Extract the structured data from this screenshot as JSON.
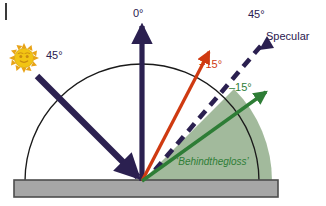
{
  "figure": {
    "background": "#ffffff"
  },
  "colors": {
    "navy": "#2b2050",
    "navy_dark": "#241a4a",
    "red": "#cf3a11",
    "green": "#2e7d36",
    "green_fill": "#9ab494",
    "substrate_fill": "#a6a6a6",
    "substrate_stroke": "#4d4d4d",
    "arc_stroke": "#1a1a1a",
    "sun_body": "#f2c413",
    "sun_ray": "#e8a317",
    "sun_face": "#c98b10"
  },
  "labels": {
    "incident_angle": "45°",
    "normal_angle": "0°",
    "plus_fifteen": "+15°",
    "minus_fifteen": "–15°",
    "specular_angle": "45°",
    "specular_name": "Specular",
    "behind_the_gloss": "‘Behindthegloss’"
  },
  "icons": {
    "sun": "sun-icon",
    "specular_arrowhead": "triangle-left-icon"
  },
  "geometry": {
    "origin_x": 142,
    "origin_y": 181,
    "arc_radius": 130,
    "substrate_left": 14,
    "substrate_right": 278,
    "substrate_top": 180,
    "substrate_bottom": 197,
    "incident_angle_deg": 45,
    "normal_angle_deg": 0,
    "plus_fifteen_deg": 15,
    "specular_angle_deg": 45,
    "minus_fifteen_deg": 60
  }
}
